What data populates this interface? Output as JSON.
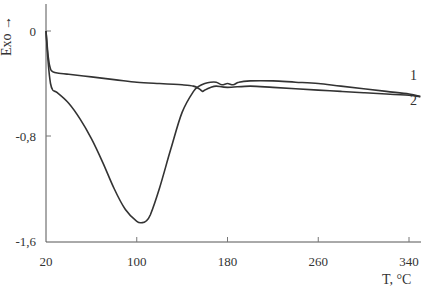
{
  "chart_data": {
    "type": "line",
    "title": "",
    "xlabel": "T, °C",
    "ylabel": "Exo →",
    "xlim": [
      20,
      350
    ],
    "ylim": [
      -1.6,
      0.2
    ],
    "xticks": [
      20,
      100,
      180,
      260,
      340
    ],
    "xtick_labels": [
      "20",
      "100",
      "180",
      "260",
      "340"
    ],
    "yticks": [
      0,
      -0.8,
      -1.6
    ],
    "ytick_labels": [
      "0",
      "-0,8",
      "-1,6"
    ],
    "grid": false,
    "legend": "inline labels at right end",
    "series": [
      {
        "name": "1",
        "x": [
          20,
          22,
          24,
          26,
          30,
          40,
          60,
          80,
          100,
          120,
          140,
          150,
          155,
          158,
          160,
          165,
          170,
          180,
          200,
          220,
          240,
          260,
          280,
          300,
          320,
          340,
          350
        ],
        "values": [
          0.0,
          -0.2,
          -0.29,
          -0.31,
          -0.32,
          -0.33,
          -0.35,
          -0.37,
          -0.39,
          -0.4,
          -0.41,
          -0.42,
          -0.44,
          -0.46,
          -0.45,
          -0.43,
          -0.42,
          -0.43,
          -0.42,
          -0.43,
          -0.44,
          -0.45,
          -0.46,
          -0.47,
          -0.48,
          -0.49,
          -0.5
        ]
      },
      {
        "name": "2",
        "x": [
          20,
          22,
          24,
          26,
          30,
          40,
          50,
          60,
          70,
          80,
          90,
          100,
          105,
          108,
          112,
          120,
          130,
          140,
          150,
          155,
          160,
          165,
          170,
          175,
          180,
          185,
          190,
          200,
          220,
          240,
          260,
          280,
          300,
          320,
          340,
          350
        ],
        "values": [
          0.0,
          -0.25,
          -0.4,
          -0.45,
          -0.47,
          -0.55,
          -0.67,
          -0.82,
          -1.0,
          -1.2,
          -1.36,
          -1.45,
          -1.46,
          -1.45,
          -1.4,
          -1.2,
          -0.9,
          -0.62,
          -0.46,
          -0.42,
          -0.4,
          -0.39,
          -0.39,
          -0.41,
          -0.4,
          -0.41,
          -0.39,
          -0.38,
          -0.38,
          -0.39,
          -0.4,
          -0.42,
          -0.44,
          -0.46,
          -0.48,
          -0.5
        ]
      }
    ]
  },
  "labels": {
    "ylabel": "Exo →",
    "xlabel_t": "T, ",
    "xlabel_unit": "°C"
  }
}
